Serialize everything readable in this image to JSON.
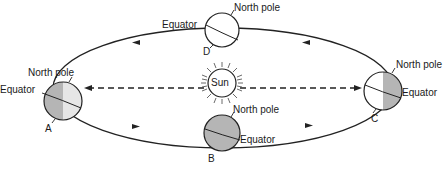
{
  "diagram": {
    "type": "earth-orbit-seasons",
    "sun": {
      "label": "Sun"
    },
    "colors": {
      "shade": "#b5b5b5",
      "light": "#e6e6e6",
      "line": "#222222",
      "background": "#ffffff"
    },
    "positions": [
      {
        "id": "A",
        "letter": "A",
        "north_pole_label": "North pole",
        "equator_label": "Equator"
      },
      {
        "id": "B",
        "letter": "B",
        "north_pole_label": "North pole",
        "equator_label": "Equator"
      },
      {
        "id": "C",
        "letter": "C",
        "north_pole_label": "North pole",
        "equator_label": "Equator"
      },
      {
        "id": "D",
        "letter": "D",
        "north_pole_label": "North pole",
        "equator_label": "Equator"
      }
    ],
    "orbit_direction": "counterclockwise (top arrows point left, bottom arrows point right)",
    "rays": "dashed arrows from Sun to positions A and C"
  }
}
